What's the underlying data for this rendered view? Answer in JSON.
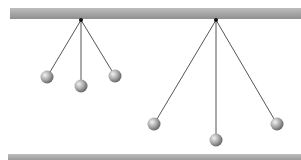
{
  "diagram": {
    "colors": {
      "bar": "#a8a8a8",
      "string": "#555555",
      "ball_light": "#e6e6e6",
      "ball_dark": "#6e6e6e",
      "pivot": "#111111"
    },
    "ceiling": {
      "y": 8,
      "height": 11
    },
    "floor": {
      "y": 154,
      "height": 8
    },
    "pendulums": [
      {
        "label": "short",
        "pivot": [
          81,
          20
        ],
        "balls": [
          [
            47,
            77
          ],
          [
            81,
            86
          ],
          [
            115,
            76
          ]
        ]
      },
      {
        "label": "long",
        "pivot": [
          216,
          20
        ],
        "balls": [
          [
            154,
            124
          ],
          [
            216,
            140
          ],
          [
            277,
            124
          ]
        ]
      }
    ]
  }
}
